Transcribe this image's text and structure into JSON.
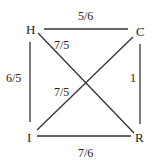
{
  "diagram": {
    "type": "weighted-graph",
    "nodes": [
      {
        "id": "H",
        "label": "H",
        "x": 31,
        "y": 34
      },
      {
        "id": "C",
        "label": "C",
        "x": 141,
        "y": 36
      },
      {
        "id": "I",
        "label": "I",
        "x": 30,
        "y": 142
      },
      {
        "id": "R",
        "label": "R",
        "x": 141,
        "y": 142
      }
    ],
    "edges": [
      {
        "from": "H",
        "to": "C",
        "weight": "5/6"
      },
      {
        "from": "H",
        "to": "I",
        "weight": "6/5"
      },
      {
        "from": "C",
        "to": "R",
        "weight": "1"
      },
      {
        "from": "I",
        "to": "R",
        "weight": "7/6"
      },
      {
        "from": "H",
        "to": "R",
        "weight": "7/5"
      },
      {
        "from": "I",
        "to": "C",
        "weight": "7/5"
      }
    ],
    "colors": {
      "line": "#333333",
      "text": "#222222",
      "background": "#ffffff"
    }
  }
}
